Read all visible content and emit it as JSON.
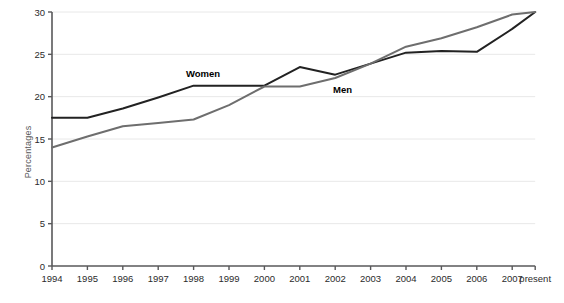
{
  "chart_data": {
    "type": "line",
    "title": "",
    "xlabel": "",
    "ylabel": "Percentages",
    "ylim": [
      0,
      30
    ],
    "ytick_step": 5,
    "yticks": [
      "0",
      "5",
      "10",
      "15",
      "20",
      "25",
      "30"
    ],
    "grid": true,
    "grid_axis": "y",
    "legend_position": "inline-labels",
    "categories": [
      "1994",
      "1995",
      "1996",
      "1997",
      "1998",
      "1999",
      "2000",
      "2001",
      "2002",
      "2003",
      "2004",
      "2005",
      "2006",
      "2007",
      "present"
    ],
    "series": [
      {
        "name": "Women",
        "color": "#222222",
        "values": [
          17.5,
          17.5,
          18.6,
          19.9,
          21.3,
          21.3,
          21.3,
          23.5,
          22.6,
          23.9,
          25.2,
          25.4,
          25.3,
          28.0,
          30.0
        ]
      },
      {
        "name": "Men",
        "color": "#6e6e6e",
        "values": [
          14.0,
          15.3,
          16.5,
          16.9,
          17.3,
          19.0,
          21.2,
          21.2,
          22.2,
          23.9,
          25.9,
          26.9,
          28.2,
          29.7,
          30.0
        ]
      }
    ],
    "annotations": [
      {
        "text": "Women",
        "series": "Women",
        "x_px": 186,
        "y_px": 77
      },
      {
        "text": "Men",
        "series": "Men",
        "x_px": 333,
        "y_px": 93
      }
    ],
    "axis_color": "#58585a",
    "grid_color": "#e8e8e8"
  }
}
